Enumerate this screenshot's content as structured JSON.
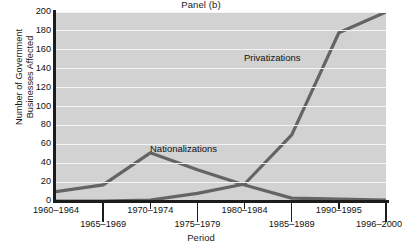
{
  "chart_data": {
    "type": "line",
    "title": "Panel (b)",
    "xlabel": "Period",
    "ylabel": "Number of Government Businesses Affected",
    "ylabel_line1": "Number of Government",
    "ylabel_line2": "Businesses Affected",
    "categories": [
      "1960–1964",
      "1965–1969",
      "1970–1974",
      "1975–1979",
      "1980–1984",
      "1985–1989",
      "1990–1995",
      "1996–2000"
    ],
    "ylim": [
      0,
      200
    ],
    "yticks": [
      200,
      180,
      160,
      140,
      120,
      100,
      80,
      60,
      40,
      20,
      0
    ],
    "ytick_step": 20,
    "grid": true,
    "legend_position": "inline-annotations",
    "series": [
      {
        "name": "Nationalizations",
        "values": [
          10,
          17,
          51,
          33,
          17,
          3,
          2,
          1
        ],
        "annotation": "Nationalizations",
        "color": "#646464"
      },
      {
        "name": "Privatizations",
        "values": [
          0,
          0,
          1,
          8,
          18,
          70,
          178,
          200
        ],
        "annotation": "Privatizations",
        "color": "#646464"
      }
    ]
  },
  "style": {
    "plot_background": "#d2d2d2",
    "gridline_color": "#f4f4f4",
    "axis_color": "#1c1c1c",
    "line_color": "#646464",
    "text_color": "#111111"
  }
}
